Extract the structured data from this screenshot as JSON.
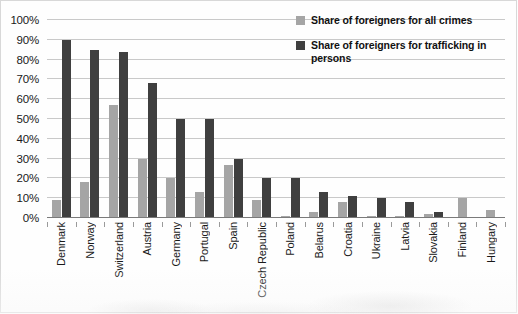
{
  "chart_data": {
    "type": "bar",
    "title": "",
    "xlabel": "",
    "ylabel": "",
    "ylim": [
      0,
      100
    ],
    "y_unit": "%",
    "grid": true,
    "legend_position": "top-right",
    "y_ticks": [
      "0%",
      "10%",
      "20%",
      "30%",
      "40%",
      "50%",
      "60%",
      "70%",
      "80%",
      "90%",
      "100%"
    ],
    "y_tick_values": [
      0,
      10,
      20,
      30,
      40,
      50,
      60,
      70,
      80,
      90,
      100
    ],
    "categories": [
      "Denmark",
      "Norway",
      "Switzerland",
      "Austria",
      "Germany",
      "Portugal",
      "Spain",
      "Czech Republic",
      "Poland",
      "Belarus",
      "Croatia",
      "Ukraine",
      "Latvia",
      "Slovakia",
      "Finland",
      "Hungary"
    ],
    "series": [
      {
        "name": "Share of foreigners for all crimes",
        "color": "#a5a5a5",
        "values": [
          9,
          18,
          57,
          30,
          20,
          13,
          27,
          9,
          1,
          3,
          8,
          1,
          1,
          2,
          10,
          4
        ]
      },
      {
        "name": "Share of foreigners for trafficking in persons",
        "color": "#3f3f3f",
        "values": [
          90,
          85,
          84,
          68,
          50,
          50,
          30,
          20,
          20,
          13,
          11,
          10,
          8,
          3,
          0,
          0
        ]
      }
    ]
  },
  "legend": {
    "items": [
      {
        "label": "Share of foreigners for all crimes",
        "swatch": "light"
      },
      {
        "label": "Share of foreigners for trafficking in persons",
        "swatch": "dark"
      }
    ]
  },
  "colors": {
    "series_light": "#a5a5a5",
    "series_dark": "#3f3f3f",
    "gridline": "#c9c9c9",
    "axis": "#7a7a7a",
    "text": "#1a1a1a",
    "background": "#ffffff"
  }
}
